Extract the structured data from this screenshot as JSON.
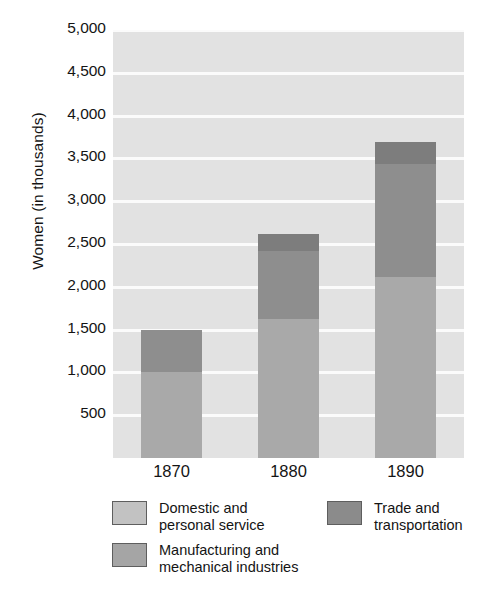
{
  "chart_data": {
    "type": "bar",
    "stacked": true,
    "title": "",
    "xlabel": "",
    "ylabel": "Women (in thousands)",
    "categories": [
      "1870",
      "1880",
      "1890"
    ],
    "series": [
      {
        "name": "Domestic and\npersonal service",
        "key": "domestic",
        "color": "#a9a9a9",
        "legend_color": "#c2c2c2",
        "values": [
          1010,
          1620,
          2120
        ]
      },
      {
        "name": "Manufacturing and\nmechanical industries",
        "key": "manufacturing",
        "color": "#8e8e8e",
        "legend_color": "#a5a5a5",
        "values": [
          490,
          800,
          1310
        ]
      },
      {
        "name": "Trade and\ntransportation",
        "key": "trade",
        "color": "#7d7d7d",
        "legend_color": "#8b8b8b",
        "values": [
          0,
          200,
          260
        ]
      }
    ],
    "totals": [
      1500,
      2620,
      3690
    ],
    "ylim": [
      0,
      5000
    ],
    "yticks": [
      500,
      1000,
      1500,
      2000,
      2500,
      3000,
      3500,
      4000,
      4500,
      5000
    ],
    "ytick_labels": [
      "500",
      "1,000",
      "1,500",
      "2,000",
      "2,500",
      "3,000",
      "3,500",
      "4,000",
      "4,500",
      "5,000"
    ],
    "grid": true,
    "grid_axis": "y",
    "legend_position": "below-plot",
    "plot_background": "#e2e2e2",
    "gridline_color": "#fbfbfb"
  },
  "axes": {
    "y_title": "Women (in thousands)"
  },
  "legend": {
    "entries": [
      {
        "label": "Domestic and\npersonal service",
        "swatch_name": "swatch-domestic"
      },
      {
        "label": "Manufacturing and\nmechanical industries",
        "swatch_name": "swatch-manufacturing"
      },
      {
        "label": "Trade and\ntransportation",
        "swatch_name": "swatch-trade"
      }
    ]
  }
}
